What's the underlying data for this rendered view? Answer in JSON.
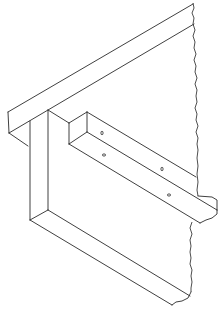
{
  "figure": {
    "title": "",
    "stroke_color": "#2a2a2a",
    "background_color": "#ffffff",
    "parts": [
      {
        "id": "diagonal-beam",
        "label": ""
      },
      {
        "id": "vertical-board",
        "label": ""
      },
      {
        "id": "cleat-bar",
        "label": "",
        "holes": 4
      },
      {
        "id": "wall-break-line",
        "label": ""
      }
    ]
  }
}
